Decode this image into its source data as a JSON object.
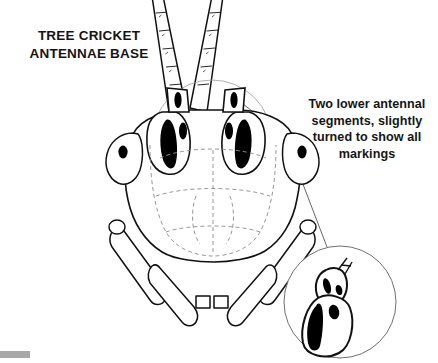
{
  "figure": {
    "title": "TREE CRICKET\nANTENNAE BASE",
    "callout": {
      "text": "Two lower antennal segments, slightly turned to show all markings",
      "leader_line_count": 2
    },
    "detail_inset": {
      "shape": "circle",
      "contents": "magnified two lower antennal segments with dark markings"
    },
    "colors": {
      "background": "#ffffff",
      "ink": "#111111",
      "line_light": "#6f6f6f",
      "fill_dark": "#000000",
      "corner_bar": "#a8a8a8"
    },
    "corner_bar_label": "scrollbar-fragment"
  }
}
